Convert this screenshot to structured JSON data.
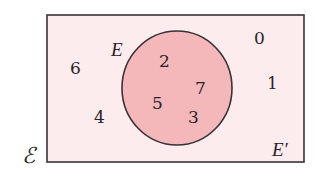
{
  "diagram": {
    "type": "venn",
    "colors": {
      "universal_fill": "#fcecee",
      "universal_stroke": "#3a3236",
      "set_fill": "#f4b8bb",
      "set_stroke": "#3a3236",
      "text": "#2a2228"
    },
    "universal_set": {
      "label": "ℰ"
    },
    "set_E": {
      "label": "E",
      "elements": [
        "2",
        "7",
        "5",
        "3"
      ]
    },
    "complement": {
      "label": "E′",
      "elements": [
        "6",
        "4",
        "0",
        "1"
      ]
    }
  }
}
